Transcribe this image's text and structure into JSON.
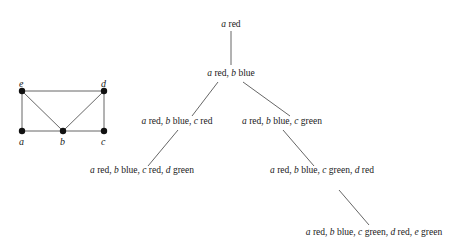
{
  "graph": {
    "nodes": [
      {
        "id": "e",
        "label": "e",
        "x": 22,
        "y": 91,
        "lx": 19,
        "ly": 87
      },
      {
        "id": "d",
        "label": "d",
        "x": 104,
        "y": 91,
        "lx": 101,
        "ly": 87
      },
      {
        "id": "a",
        "label": "a",
        "x": 22,
        "y": 131,
        "lx": 19,
        "ly": 145
      },
      {
        "id": "b",
        "label": "b",
        "x": 63,
        "y": 131,
        "lx": 60,
        "ly": 145
      },
      {
        "id": "c",
        "label": "c",
        "x": 104,
        "y": 131,
        "lx": 101,
        "ly": 145
      }
    ],
    "edges": [
      [
        "e",
        "d"
      ],
      [
        "e",
        "a"
      ],
      [
        "e",
        "b"
      ],
      [
        "d",
        "b"
      ],
      [
        "d",
        "c"
      ],
      [
        "a",
        "b"
      ],
      [
        "b",
        "c"
      ]
    ]
  },
  "tree": {
    "nodes": [
      {
        "id": "n1",
        "x": 231,
        "y": 27,
        "parts": [
          [
            "a",
            " red"
          ]
        ],
        "text": "a red"
      },
      {
        "id": "n2",
        "x": 231,
        "y": 76,
        "parts": [
          [
            "a",
            " red, "
          ],
          [
            "b",
            " blue"
          ]
        ],
        "text": "a red, b blue"
      },
      {
        "id": "n3",
        "x": 177,
        "y": 124,
        "parts": [
          [
            "a",
            " red, "
          ],
          [
            "b",
            " blue, "
          ],
          [
            "c",
            " red"
          ]
        ],
        "text": "a red, b blue, c red"
      },
      {
        "id": "n4",
        "x": 282,
        "y": 124,
        "parts": [
          [
            "a",
            " red, "
          ],
          [
            "b",
            " blue, "
          ],
          [
            "c",
            " green"
          ]
        ],
        "text": "a red, b blue, c green"
      },
      {
        "id": "n5",
        "x": 142,
        "y": 173,
        "parts": [
          [
            "a",
            " red, "
          ],
          [
            "b",
            " blue, "
          ],
          [
            "c",
            " red, "
          ],
          [
            "d",
            " green"
          ]
        ],
        "text": "a red, b blue, c red, d green"
      },
      {
        "id": "n6",
        "x": 322,
        "y": 173,
        "parts": [
          [
            "a",
            " red, "
          ],
          [
            "b",
            " blue, "
          ],
          [
            "c",
            " green, "
          ],
          [
            "d",
            " red"
          ]
        ],
        "text": "a red, b blue, c green, d red"
      },
      {
        "id": "n7",
        "x": 374,
        "y": 235,
        "parts": [
          [
            "a",
            " red, "
          ],
          [
            "b",
            " blue, "
          ],
          [
            "c",
            " green, "
          ],
          [
            "d",
            " red, "
          ],
          [
            "e",
            " green"
          ]
        ],
        "text": "a red, b blue, c green, d red, e green"
      }
    ],
    "edges": [
      {
        "from": "n1",
        "to": "n2",
        "x1": 231,
        "y1": 31,
        "x2": 231,
        "y2": 65
      },
      {
        "from": "n2",
        "to": "n3",
        "x1": 218,
        "y1": 82,
        "x2": 192,
        "y2": 116
      },
      {
        "from": "n2",
        "to": "n4",
        "x1": 243,
        "y1": 82,
        "x2": 290,
        "y2": 116
      },
      {
        "from": "n3",
        "to": "n5",
        "x1": 178,
        "y1": 130,
        "x2": 148,
        "y2": 166
      },
      {
        "from": "n4",
        "to": "n6",
        "x1": 283,
        "y1": 130,
        "x2": 314,
        "y2": 166
      },
      {
        "from": "n6",
        "to": "n7",
        "x1": 339,
        "y1": 190,
        "x2": 369,
        "y2": 225
      }
    ]
  }
}
